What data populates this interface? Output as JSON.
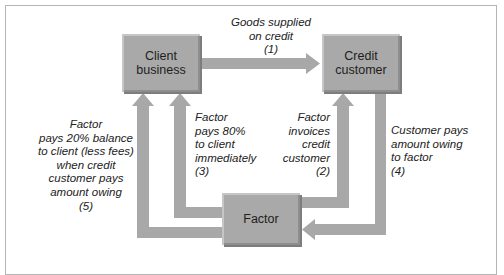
{
  "diagram": {
    "nodes": {
      "client_business": {
        "lines": [
          "Client",
          "business"
        ]
      },
      "credit_customer": {
        "lines": [
          "Credit",
          "customer"
        ]
      },
      "factor": {
        "lines": [
          "Factor"
        ]
      }
    },
    "flows": {
      "goods_supplied": {
        "step": "(1)",
        "lines": [
          "Goods supplied",
          "on credit",
          "(1)"
        ],
        "from": "Client business",
        "to": "Credit customer"
      },
      "factor_invoices": {
        "step": "(2)",
        "lines": [
          "Factor",
          "invoices",
          "credit",
          "customer",
          "(2)"
        ],
        "from": "Factor",
        "to": "Credit customer"
      },
      "factor_pays_80": {
        "step": "(3)",
        "lines": [
          "Factor",
          "pays 80%",
          "to client",
          "immediately",
          "(3)"
        ],
        "from": "Factor",
        "to": "Client business"
      },
      "customer_pays": {
        "step": "(4)",
        "lines": [
          "Customer pays",
          "amount owing",
          "to factor",
          "(4)"
        ],
        "from": "Credit customer",
        "to": "Factor"
      },
      "factor_pays_20": {
        "step": "(5)",
        "lines": [
          "Factor",
          "pays 20% balance",
          "to client (less fees)",
          "when credit",
          "customer pays",
          "amount owing",
          "(5)"
        ],
        "from": "Factor",
        "to": "Client business"
      }
    },
    "colors": {
      "box_fill": "#a9a9a9",
      "arrow_fill": "#a8a8a8",
      "frame_border": "#b5b5b5",
      "text": "#222222"
    }
  }
}
